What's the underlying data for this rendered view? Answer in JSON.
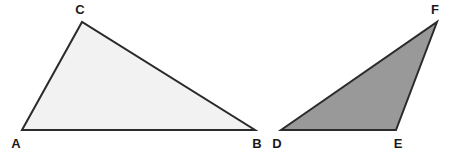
{
  "figure": {
    "background_color": "#ffffff",
    "width": 452,
    "height": 158
  },
  "style": {
    "stroke_color": "#2b2b2b",
    "stroke_width": 2,
    "label_color": "#1a1a1a",
    "label_font_size": 13
  },
  "shapes": [
    {
      "name": "triangle-abc",
      "label": "Triangle ABC",
      "fill_color": "#f2f2f2",
      "stroke_color": "#2b2b2b",
      "points": "22,130 82,22 255,130",
      "vertices": [
        {
          "name": "A",
          "x": 22,
          "y": 130,
          "label_x": 16,
          "label_y": 143
        },
        {
          "name": "C",
          "x": 82,
          "y": 22,
          "label_x": 80,
          "label_y": 9
        },
        {
          "name": "B",
          "x": 255,
          "y": 130,
          "label_x": 257,
          "label_y": 143
        }
      ]
    },
    {
      "name": "triangle-def",
      "label": "Triangle DEF",
      "fill_color": "#999999",
      "stroke_color": "#2b2b2b",
      "points": "281,130 437,22 396,130",
      "vertices": [
        {
          "name": "D",
          "x": 281,
          "y": 130,
          "label_x": 277,
          "label_y": 143
        },
        {
          "name": "F",
          "x": 437,
          "y": 22,
          "label_x": 435,
          "label_y": 9
        },
        {
          "name": "E",
          "x": 396,
          "y": 130,
          "label_x": 398,
          "label_y": 143
        }
      ]
    }
  ],
  "labels": {
    "a": "A",
    "b": "B",
    "c": "C",
    "d": "D",
    "e": "E",
    "f": "F"
  }
}
